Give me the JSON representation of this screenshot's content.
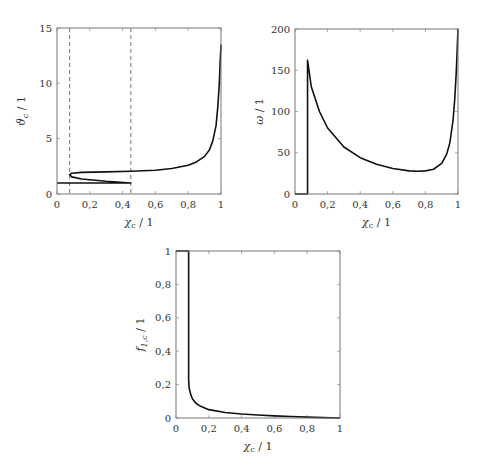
{
  "chart_data": [
    {
      "id": "theta",
      "type": "line",
      "title": "",
      "xlabel": "χc / 1",
      "ylabel": "ϑc / 1",
      "xlim": [
        0,
        1
      ],
      "ylim": [
        0,
        15
      ],
      "xticks": [
        "0",
        "0,2",
        "0,4",
        "0,6",
        "0,8",
        "1"
      ],
      "yticks": [
        "0",
        "5",
        "10",
        "15"
      ],
      "ytick_values": [
        0,
        5,
        10,
        15
      ],
      "grid": false,
      "dashed_vlines": [
        0.077,
        0.45
      ],
      "series": [
        {
          "name": "ϑc",
          "x": [
            0,
            0.45,
            0.3,
            0.15,
            0.09,
            0.077,
            0.09,
            0.15,
            0.3,
            0.45,
            0.6,
            0.7,
            0.8,
            0.85,
            0.9,
            0.93,
            0.95,
            0.97,
            0.98,
            0.99,
            0.995,
            1.0
          ],
          "y": [
            1.0,
            1.0,
            1.15,
            1.35,
            1.55,
            1.75,
            1.88,
            1.95,
            2.0,
            2.05,
            2.15,
            2.3,
            2.6,
            2.9,
            3.4,
            4.0,
            4.8,
            6.2,
            7.8,
            10.0,
            12.0,
            13.5
          ]
        }
      ]
    },
    {
      "id": "omega",
      "type": "line",
      "title": "",
      "xlabel": "χc / 1",
      "ylabel": "ω / 1",
      "xlim": [
        0,
        1
      ],
      "ylim": [
        0,
        200
      ],
      "xticks": [
        "0",
        "0,2",
        "0,4",
        "0,6",
        "0,8",
        "1"
      ],
      "yticks": [
        "0",
        "50",
        "100",
        "150",
        "200"
      ],
      "ytick_values": [
        0,
        50,
        100,
        150,
        200
      ],
      "grid": false,
      "series": [
        {
          "name": "ω",
          "x": [
            0,
            0.077,
            0.077,
            0.1,
            0.15,
            0.2,
            0.3,
            0.4,
            0.5,
            0.6,
            0.7,
            0.75,
            0.8,
            0.85,
            0.9,
            0.93,
            0.95,
            0.97,
            0.98,
            0.99,
            1.0
          ],
          "y": [
            0,
            0,
            162,
            130,
            100,
            80,
            57,
            44,
            36,
            31,
            28,
            27.5,
            28,
            30,
            37,
            48,
            62,
            90,
            115,
            150,
            200
          ]
        }
      ]
    },
    {
      "id": "f1c",
      "type": "line",
      "title": "",
      "xlabel": "χc / 1",
      "ylabel": "f1,c / 1",
      "xlim": [
        0,
        1
      ],
      "ylim": [
        0,
        1
      ],
      "xticks": [
        "0",
        "0,2",
        "0,4",
        "0,6",
        "0,8",
        "1"
      ],
      "yticks": [
        "0",
        "0,2",
        "0,4",
        "0,6",
        "0,8",
        "1"
      ],
      "ytick_values": [
        0,
        0.2,
        0.4,
        0.6,
        0.8,
        1
      ],
      "grid": false,
      "series": [
        {
          "name": "f1,c",
          "x": [
            0,
            0.077,
            0.077,
            0.08,
            0.09,
            0.1,
            0.12,
            0.15,
            0.2,
            0.3,
            0.4,
            0.5,
            0.6,
            0.7,
            0.8,
            0.9,
            1.0
          ],
          "y": [
            1,
            1,
            0.23,
            0.18,
            0.14,
            0.115,
            0.09,
            0.07,
            0.05,
            0.033,
            0.024,
            0.018,
            0.013,
            0.009,
            0.005,
            0.002,
            0
          ]
        }
      ]
    }
  ],
  "labels": {
    "theta": {
      "xlabel": "χc / 1",
      "ylabel": "ϑc / 1"
    },
    "omega": {
      "xlabel": "χc / 1",
      "ylabel": "ω / 1"
    },
    "f1c": {
      "xlabel": "χc / 1",
      "ylabel": "f1,c / 1"
    }
  }
}
